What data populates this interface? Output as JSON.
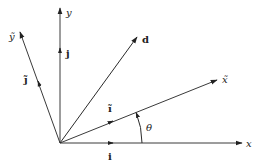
{
  "diagram": {
    "type": "vector-rotation-diagram",
    "origin": [
      60,
      143
    ],
    "axes": [
      {
        "id": "x",
        "label": "x",
        "style": "italic",
        "end": [
          242,
          143
        ],
        "label_pos": [
          246,
          147
        ]
      },
      {
        "id": "y",
        "label": "y",
        "style": "italic",
        "end": [
          60,
          8
        ],
        "label_pos": [
          66,
          16
        ]
      },
      {
        "id": "x-tilde",
        "label": "x̃",
        "style": "italic",
        "end": [
          217,
          80
        ],
        "label_pos": [
          222,
          83
        ]
      },
      {
        "id": "y-tilde",
        "label": "ỹ",
        "style": "italic",
        "end": [
          20,
          32
        ],
        "label_pos": [
          9,
          40
        ]
      }
    ],
    "unit_vectors": [
      {
        "id": "i",
        "label": "i",
        "style": "bold",
        "head": [
          113,
          143
        ],
        "label_pos": [
          108,
          160
        ]
      },
      {
        "id": "j",
        "label": "j",
        "style": "bold",
        "head": [
          60,
          48
        ],
        "label_pos": [
          66,
          57
        ]
      },
      {
        "id": "i-tilde",
        "label": "ĩ",
        "style": "bold",
        "head": [
          113,
          121
        ],
        "label_pos": [
          108,
          112
        ]
      },
      {
        "id": "j-tilde",
        "label": "j̃",
        "style": "bold",
        "head": [
          38,
          81
        ],
        "label_pos": [
          24,
          83
        ]
      }
    ],
    "vector_d": {
      "label": "d",
      "style": "bold",
      "end": [
        137,
        37
      ],
      "label_pos": [
        142,
        43
      ]
    },
    "angle": {
      "label": "θ",
      "label_pos": [
        146,
        131
      ],
      "arc_radius": 82
    }
  }
}
